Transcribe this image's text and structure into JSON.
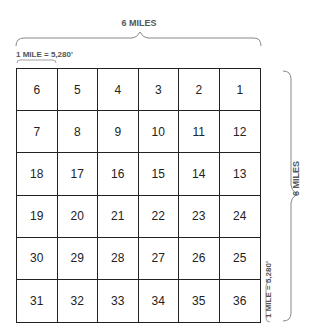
{
  "diagram": {
    "title_top": "6 MILES",
    "scale_top": "1 MILE = 5,280'",
    "title_side": "6 MILES",
    "scale_side": "1 MILE = 5,280'",
    "sections": [
      [
        6,
        5,
        4,
        3,
        2,
        1
      ],
      [
        7,
        8,
        9,
        10,
        11,
        12
      ],
      [
        18,
        17,
        16,
        15,
        14,
        13
      ],
      [
        19,
        20,
        21,
        22,
        23,
        24
      ],
      [
        30,
        29,
        28,
        27,
        26,
        25
      ],
      [
        31,
        32,
        33,
        34,
        35,
        36
      ]
    ]
  }
}
